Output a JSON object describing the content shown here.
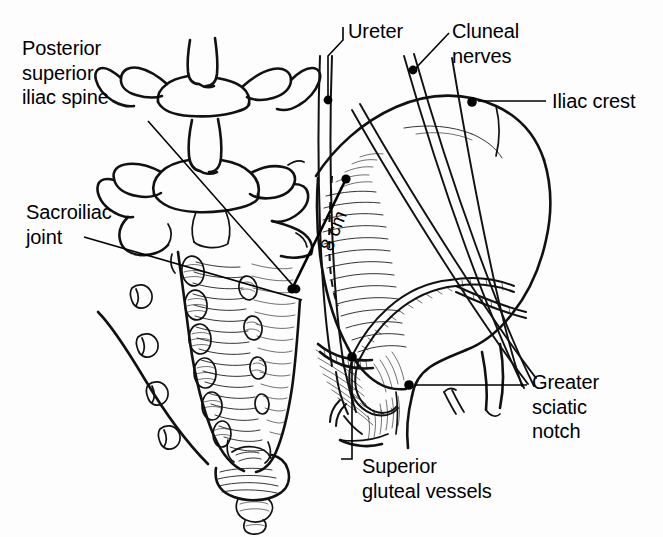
{
  "figure": {
    "kind": "anatomical-line-illustration",
    "width": 663,
    "height": 537,
    "background_color": "#fdfdfd",
    "ink_color": "#111111"
  },
  "labels": [
    {
      "id": "posterior-superior-iliac-spine",
      "text": "Posterior\nsuperior\niliac spine",
      "lines": [
        "Posterior",
        "superior",
        "iliac spine"
      ],
      "x": 22,
      "y": 36,
      "align": "left",
      "leader": {
        "from": [
          148,
          121
        ],
        "to": [
          296,
          289
        ],
        "dot_at_end": true
      }
    },
    {
      "id": "sacroiliac-joint",
      "text": "Sacroiliac\njoint",
      "lines": [
        "Sacroiliac",
        "joint"
      ],
      "x": 26,
      "y": 200,
      "align": "left",
      "leader": {
        "from": [
          82,
          237
        ],
        "to": [
          300,
          300
        ],
        "dot_at_end": false
      }
    },
    {
      "id": "ureter",
      "text": "Ureter",
      "lines": [
        "Ureter"
      ],
      "x": 348,
      "y": 19,
      "align": "left",
      "leader": {
        "from": [
          343,
          25
        ],
        "to": [
          327,
          100
        ],
        "dot_at_end": true,
        "bracket": true
      }
    },
    {
      "id": "cluneal-nerves",
      "text": "Cluneal\nnerves",
      "lines": [
        "Cluneal",
        "nerves"
      ],
      "x": 452,
      "y": 19,
      "align": "left",
      "leader": {
        "from": [
          447,
          33
        ],
        "to": [
          412,
          69
        ],
        "dot_at_end": true
      }
    },
    {
      "id": "iliac-crest",
      "text": "Iliac crest",
      "lines": [
        "Iliac crest"
      ],
      "x": 552,
      "y": 89,
      "align": "left",
      "leader": {
        "from": [
          545,
          101
        ],
        "to": [
          472,
          102
        ],
        "dot_at_end": true
      }
    },
    {
      "id": "greater-sciatic-notch",
      "text": "Greater\nsciatic\nnotch",
      "lines": [
        "Greater",
        "sciatic",
        "notch"
      ],
      "x": 532,
      "y": 370,
      "align": "left",
      "leader": {
        "from": [
          527,
          385
        ],
        "to": [
          409,
          385
        ],
        "dot_at_end": true
      }
    },
    {
      "id": "superior-gluteal-vessels",
      "text": "Superior\ngluteal vessels",
      "lines": [
        "Superior",
        "gluteal vessels"
      ],
      "x": 362,
      "y": 454,
      "align": "left",
      "leader": {
        "from": [
          352,
          459
        ],
        "to": [
          352,
          356
        ],
        "dot_at_end": true,
        "bracket": true
      }
    }
  ],
  "measurement": {
    "id": "sciatic-notch-distance",
    "value": "8 cm",
    "unit": "cm",
    "magnitude": 8,
    "label_x": 316,
    "label_y": 246,
    "rotation_deg": -68,
    "line_from": [
      346,
      179
    ],
    "line_to": [
      292,
      289
    ],
    "endpoint_dots": true,
    "description": "Distance measured along the posterior ilium from the posterior superior iliac spine region toward the greater sciatic notch"
  },
  "structures": [
    {
      "name": "lumbar-vertebrae",
      "count": 2,
      "region": "top-center"
    },
    {
      "name": "sacrum",
      "region": "center-left"
    },
    {
      "name": "posterior-sacral-foramina",
      "count": 4,
      "region": "sacrum"
    },
    {
      "name": "coccyx",
      "region": "bottom-center"
    },
    {
      "name": "ilium",
      "region": "right"
    },
    {
      "name": "iliac-crest",
      "region": "upper-right"
    },
    {
      "name": "greater-sciatic-notch",
      "region": "lower-center-right"
    },
    {
      "name": "cluneal-nerves",
      "count": 3,
      "region": "upper-right"
    },
    {
      "name": "ureter",
      "region": "upper-center"
    },
    {
      "name": "superior-gluteal-vessels",
      "region": "center"
    },
    {
      "name": "sacroiliac-joint",
      "region": "center"
    }
  ]
}
